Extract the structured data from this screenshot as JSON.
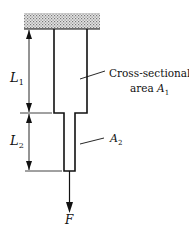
{
  "diagram": {
    "type": "stepped bar under axial load",
    "labels": {
      "L1": {
        "main": "L",
        "sub": "1"
      },
      "L2": {
        "main": "L",
        "sub": "2"
      },
      "area1_line1": "Cross-sectional",
      "area1_line2": "area ",
      "A1": {
        "main": "A",
        "sub": "1"
      },
      "A2": {
        "main": "A",
        "sub": "2"
      },
      "force": "F"
    },
    "colors": {
      "ink": "#111111",
      "support_fill": "#b8b8b8",
      "background": "#ffffff"
    }
  }
}
